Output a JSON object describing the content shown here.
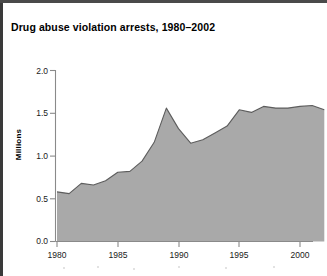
{
  "figure": {
    "title": "Drug abuse violation arrests, 1980–2002",
    "background_color": "#ffffff",
    "fill_color": "#a9a9a9",
    "line_color": "#5d5d5d",
    "axis_color": "#8a8a8a"
  },
  "axes": {
    "y_label": "Millions",
    "y_tick_labels": [
      "0.0",
      "0.5",
      "1.0",
      "1.5",
      "2.0"
    ],
    "x_tick_labels": [
      "1980",
      "1985",
      "1990",
      "1995",
      "2000"
    ]
  },
  "chart_data": {
    "type": "area",
    "title": "Drug abuse violation arrests, 1980–2002",
    "xlabel": "",
    "ylabel": "Millions",
    "xlim": [
      1980,
      2002
    ],
    "ylim": [
      0.0,
      2.0
    ],
    "yticks": [
      0.0,
      0.5,
      1.0,
      1.5,
      2.0
    ],
    "xticks": [
      1980,
      1985,
      1990,
      1995,
      2000
    ],
    "grid": false,
    "legend": "none",
    "units": "millions of arrests",
    "x": [
      1980,
      1981,
      1982,
      1983,
      1984,
      1985,
      1986,
      1987,
      1988,
      1989,
      1990,
      1991,
      1992,
      1993,
      1994,
      1995,
      1996,
      1997,
      1998,
      1999,
      2000,
      2001,
      2002
    ],
    "values": [
      0.58,
      0.56,
      0.68,
      0.66,
      0.71,
      0.81,
      0.82,
      0.94,
      1.16,
      1.56,
      1.32,
      1.15,
      1.19,
      1.27,
      1.35,
      1.54,
      1.51,
      1.58,
      1.56,
      1.56,
      1.58,
      1.59,
      1.54
    ],
    "series": [
      {
        "name": "Drug abuse violation arrests",
        "values": [
          0.58,
          0.56,
          0.68,
          0.66,
          0.71,
          0.81,
          0.82,
          0.94,
          1.16,
          1.56,
          1.32,
          1.15,
          1.19,
          1.27,
          1.35,
          1.54,
          1.51,
          1.58,
          1.56,
          1.56,
          1.58,
          1.59,
          1.54
        ]
      }
    ],
    "annotations": []
  }
}
